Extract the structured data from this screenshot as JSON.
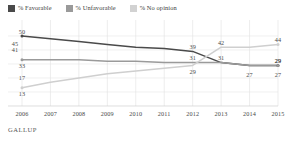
{
  "legend": {
    "items": [
      {
        "key": "favorable",
        "label": "% Favorable",
        "color": "#4a4a4a"
      },
      {
        "key": "unfavorable",
        "label": "% Unfavorable",
        "color": "#9a9a9a"
      },
      {
        "key": "no_opinion",
        "label": "% No opinion",
        "color": "#d2d2d2"
      }
    ]
  },
  "source": {
    "label": "GALLUP"
  },
  "chart_data": {
    "type": "line",
    "title": "",
    "subtitle": "",
    "xlabel": "",
    "ylabel": "",
    "categories": [
      2006,
      2007,
      2008,
      2009,
      2010,
      2011,
      2012,
      2013,
      2014,
      2015
    ],
    "tick_labels": [
      "2006",
      "2007",
      "2008",
      "2009",
      "2010",
      "2011",
      "2012",
      "2013",
      "2014",
      "2015"
    ],
    "ylim": [
      0,
      60
    ],
    "xlim": [
      2006,
      2015
    ],
    "grid": "vertical-and-horizontal",
    "legend_position": "top-left",
    "series": [
      {
        "name": "% Favorable",
        "color": "#4a4a4a",
        "values": [
          50,
          48,
          46,
          44,
          42,
          41,
          39,
          31,
          29,
          29
        ],
        "point_labels": [
          {
            "x": 2006,
            "value": 50,
            "text": "50",
            "pos": "above"
          },
          {
            "x": 2006,
            "value": 45,
            "text": "45",
            "pos": "left"
          },
          {
            "x": 2012,
            "value": 39,
            "text": "39",
            "pos": "above"
          },
          {
            "x": 2013,
            "value": 31,
            "text": "31",
            "pos": "above"
          },
          {
            "x": 2015,
            "value": 29,
            "text": "29",
            "pos": "above"
          }
        ]
      },
      {
        "name": "% Unfavorable",
        "color": "#9a9a9a",
        "values": [
          33,
          33,
          33,
          32,
          32,
          31,
          31,
          31,
          29,
          29
        ],
        "point_labels": [
          {
            "x": 2006,
            "value": 41,
            "text": "41",
            "pos": "left"
          },
          {
            "x": 2006,
            "value": 33,
            "text": "33",
            "pos": "below"
          },
          {
            "x": 2012,
            "value": 31,
            "text": "31",
            "pos": "above"
          },
          {
            "x": 2015,
            "value": 29,
            "text": "29",
            "pos": "above"
          }
        ]
      },
      {
        "name": "% No opinion",
        "color": "#cfcfcf",
        "values": [
          13,
          17,
          20,
          23,
          25,
          27,
          29,
          42,
          42,
          44
        ],
        "point_labels": [
          {
            "x": 2006,
            "value": 17,
            "text": "17",
            "pos": "above"
          },
          {
            "x": 2006,
            "value": 13,
            "text": "13",
            "pos": "below"
          },
          {
            "x": 2012,
            "value": 29,
            "text": "29",
            "pos": "below"
          },
          {
            "x": 2013,
            "value": 42,
            "text": "42",
            "pos": "above"
          },
          {
            "x": 2014,
            "value": 27,
            "text": "27",
            "pos": "below"
          },
          {
            "x": 2015,
            "value": 44,
            "text": "44",
            "pos": "above"
          },
          {
            "x": 2015,
            "value": 27,
            "text": "27",
            "pos": "below"
          }
        ]
      }
    ]
  }
}
